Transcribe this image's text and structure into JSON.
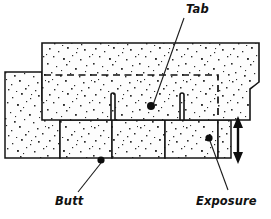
{
  "diagram": {
    "type": "technical-line-drawing",
    "background_color": "#ffffff",
    "ink_color": "#111111",
    "texture": "speckled-granule-fill",
    "labels": {
      "tab": "Tab",
      "butt": "Butt",
      "exposure": "Exposure"
    },
    "callouts": [
      {
        "id": "tab",
        "label": "Tab",
        "label_x": 186,
        "label_y": 4,
        "leader_from_x": 184,
        "leader_from_y": 18,
        "leader_to_x": 153,
        "leader_to_y": 105,
        "dot_x": 151,
        "dot_y": 106
      },
      {
        "id": "butt",
        "label": "Butt",
        "label_x": 55,
        "label_y": 196,
        "leader_from_x": 78,
        "leader_from_y": 192,
        "leader_to_x": 101,
        "leader_to_y": 163,
        "dot_x": 101,
        "dot_y": 160
      },
      {
        "id": "exposure",
        "label": "Exposure",
        "label_x": 196,
        "label_y": 196,
        "leader_from_x": 228,
        "leader_from_y": 190,
        "leader_to_x": 210,
        "leader_to_y": 141,
        "dot_x": 209,
        "dot_y": 138
      }
    ],
    "dimension": {
      "name": "exposure-dimension-arrow",
      "orientation": "vertical",
      "double_headed": true,
      "x": 238,
      "y_top": 118,
      "y_bottom": 162
    },
    "guide": {
      "name": "hidden-edge-dashed-line",
      "style": "dashed",
      "horizontal_y": 75,
      "x_start": 44,
      "x_end": 218,
      "vertical_x": 218,
      "vertical_y_end": 119
    },
    "slots": [
      {
        "name": "tab-slot-left",
        "x": 111,
        "y_top": 93,
        "y_bottom": 120,
        "width": 4
      },
      {
        "name": "tab-slot-right",
        "x": 180,
        "y_top": 93,
        "y_bottom": 120,
        "width": 4
      }
    ],
    "courses": [
      {
        "name": "upper-course-shingle",
        "description": "Top shingle strip with two tab slots and notched right edge",
        "top": 43,
        "bottom": 120,
        "left": 42,
        "right": 259
      },
      {
        "name": "lower-course-left-shingle",
        "description": "Partially exposed shingle at far left with wavy edge notch",
        "top": 72,
        "bottom": 158,
        "left": 5,
        "right": 60
      },
      {
        "name": "lower-course-tab-1",
        "top": 120,
        "bottom": 158,
        "left": 60,
        "right": 112
      },
      {
        "name": "lower-course-tab-2",
        "top": 120,
        "bottom": 158,
        "left": 112,
        "right": 165
      },
      {
        "name": "lower-course-tab-3",
        "top": 120,
        "bottom": 158,
        "left": 165,
        "right": 218
      }
    ]
  }
}
